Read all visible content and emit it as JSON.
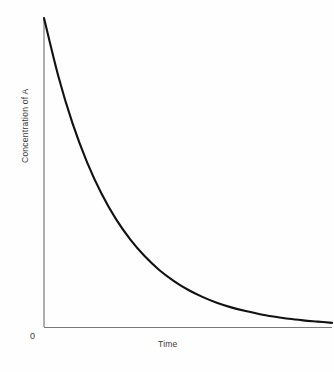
{
  "chart_data": {
    "type": "line",
    "title": "",
    "subtitle": "",
    "xlabel": "Time",
    "ylabel": "Concentration of A",
    "origin_label": "0",
    "grid": false,
    "legend": null,
    "annotations": [],
    "axis": {
      "x_tick_labels": [],
      "y_tick_labels": [],
      "xlim": [
        0,
        1
      ],
      "ylim": [
        0,
        1
      ],
      "x_axis_arrow": false,
      "y_axis_arrow": false
    },
    "curve_color": "#111111",
    "axis_color": "#7a7a7a",
    "background_color": "#fefefe",
    "series": [
      {
        "name": "Concentration of A",
        "description": "first-order exponential decay",
        "model": "y = exp(-k * x)",
        "decay_constant_k": 4.2,
        "x": [
          0.0,
          0.05,
          0.1,
          0.15,
          0.2,
          0.25,
          0.3,
          0.35,
          0.4,
          0.45,
          0.5,
          0.55,
          0.6,
          0.65,
          0.7,
          0.75,
          0.8,
          0.85,
          0.9,
          0.95,
          1.0
        ],
        "values": [
          1.0,
          0.811,
          0.657,
          0.533,
          0.432,
          0.35,
          0.284,
          0.23,
          0.186,
          0.151,
          0.122,
          0.099,
          0.08,
          0.065,
          0.053,
          0.043,
          0.035,
          0.028,
          0.023,
          0.019,
          0.015
        ]
      }
    ]
  }
}
